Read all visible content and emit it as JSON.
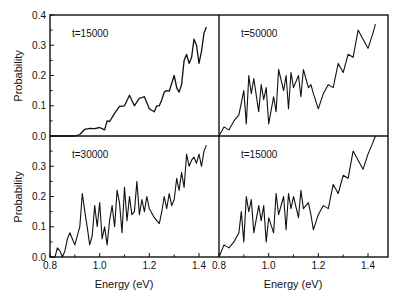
{
  "chart_data": {
    "type": "line",
    "layout": "2x2 panels, shared axes",
    "xlabel": "Energy (eV)",
    "ylabel": "Probability",
    "xlim": [
      0.8,
      1.45
    ],
    "ylim": [
      0.0,
      0.4
    ],
    "x_ticks": [
      "0.8",
      "1.0",
      "1.2",
      "1.4"
    ],
    "y_ticks_top": [
      "0.0",
      "0.1",
      "0.2",
      "0.3",
      "0.4"
    ],
    "y_ticks_bottom": [
      "0.0",
      "0.1",
      "0.2",
      "0.3"
    ],
    "grid": false,
    "legend": "none",
    "panels": [
      {
        "position": "top-left",
        "label": "t=15000",
        "x": [
          0.8,
          0.85,
          0.9,
          0.92,
          0.94,
          0.96,
          0.98,
          1.0,
          1.02,
          1.03,
          1.04,
          1.06,
          1.08,
          1.1,
          1.12,
          1.14,
          1.16,
          1.17,
          1.18,
          1.2,
          1.22,
          1.23,
          1.24,
          1.25,
          1.26,
          1.27,
          1.28,
          1.3,
          1.31,
          1.32,
          1.33,
          1.34,
          1.35,
          1.36,
          1.37,
          1.38,
          1.39,
          1.4,
          1.41,
          1.42,
          1.43
        ],
        "y": [
          0.0,
          0.0,
          0.0,
          0.005,
          0.022,
          0.025,
          0.024,
          0.028,
          0.02,
          0.05,
          0.048,
          0.075,
          0.098,
          0.1,
          0.135,
          0.1,
          0.125,
          0.127,
          0.13,
          0.09,
          0.08,
          0.1,
          0.1,
          0.12,
          0.145,
          0.15,
          0.148,
          0.2,
          0.16,
          0.145,
          0.17,
          0.25,
          0.27,
          0.24,
          0.26,
          0.32,
          0.3,
          0.24,
          0.28,
          0.34,
          0.36
        ]
      },
      {
        "position": "top-right",
        "label": "t=50000",
        "x": [
          0.8,
          0.82,
          0.84,
          0.86,
          0.88,
          0.9,
          0.91,
          0.92,
          0.93,
          0.94,
          0.96,
          0.97,
          0.98,
          0.99,
          1.0,
          1.02,
          1.03,
          1.04,
          1.06,
          1.07,
          1.08,
          1.09,
          1.1,
          1.12,
          1.13,
          1.14,
          1.16,
          1.17,
          1.18,
          1.2,
          1.22,
          1.24,
          1.26,
          1.28,
          1.3,
          1.32,
          1.34,
          1.36,
          1.38,
          1.4,
          1.42,
          1.43
        ],
        "y": [
          0.0,
          0.03,
          0.02,
          0.05,
          0.07,
          0.15,
          0.04,
          0.2,
          0.14,
          0.19,
          0.08,
          0.17,
          0.12,
          0.16,
          0.04,
          0.13,
          0.08,
          0.22,
          0.15,
          0.2,
          0.09,
          0.21,
          0.16,
          0.2,
          0.13,
          0.22,
          0.16,
          0.17,
          0.14,
          0.09,
          0.14,
          0.17,
          0.16,
          0.24,
          0.21,
          0.27,
          0.26,
          0.35,
          0.32,
          0.29,
          0.34,
          0.37
        ]
      },
      {
        "position": "bottom-left",
        "label": "t=30000",
        "x": [
          0.8,
          0.82,
          0.83,
          0.84,
          0.85,
          0.86,
          0.87,
          0.88,
          0.89,
          0.9,
          0.92,
          0.93,
          0.94,
          0.95,
          0.96,
          0.97,
          0.98,
          0.99,
          1.0,
          1.01,
          1.02,
          1.03,
          1.04,
          1.05,
          1.06,
          1.07,
          1.08,
          1.09,
          1.1,
          1.11,
          1.12,
          1.13,
          1.14,
          1.15,
          1.16,
          1.17,
          1.18,
          1.19,
          1.2,
          1.22,
          1.24,
          1.25,
          1.26,
          1.27,
          1.28,
          1.29,
          1.3,
          1.31,
          1.32,
          1.33,
          1.34,
          1.35,
          1.36,
          1.37,
          1.38,
          1.39,
          1.4,
          1.41,
          1.42,
          1.43
        ],
        "y": [
          0.0,
          0.0,
          0.03,
          0.02,
          0.0,
          0.02,
          0.06,
          0.08,
          0.06,
          0.04,
          0.1,
          0.21,
          0.15,
          0.1,
          0.04,
          0.07,
          0.17,
          0.1,
          0.18,
          0.06,
          0.1,
          0.04,
          0.12,
          0.17,
          0.1,
          0.22,
          0.18,
          0.08,
          0.23,
          0.12,
          0.2,
          0.14,
          0.15,
          0.25,
          0.14,
          0.19,
          0.15,
          0.2,
          0.16,
          0.13,
          0.11,
          0.15,
          0.2,
          0.16,
          0.21,
          0.17,
          0.19,
          0.26,
          0.22,
          0.28,
          0.23,
          0.34,
          0.3,
          0.32,
          0.33,
          0.31,
          0.34,
          0.3,
          0.35,
          0.37
        ]
      },
      {
        "position": "bottom-right",
        "label": "t=15000",
        "x": [
          0.8,
          0.82,
          0.84,
          0.86,
          0.88,
          0.89,
          0.9,
          0.91,
          0.92,
          0.93,
          0.94,
          0.96,
          0.97,
          0.98,
          0.99,
          1.0,
          1.02,
          1.03,
          1.04,
          1.06,
          1.07,
          1.08,
          1.09,
          1.1,
          1.12,
          1.13,
          1.14,
          1.16,
          1.17,
          1.18,
          1.2,
          1.22,
          1.24,
          1.26,
          1.28,
          1.3,
          1.32,
          1.34,
          1.36,
          1.38,
          1.4,
          1.42,
          1.43
        ],
        "y": [
          0.0,
          0.04,
          0.03,
          0.05,
          0.08,
          0.15,
          0.05,
          0.2,
          0.15,
          0.19,
          0.08,
          0.17,
          0.12,
          0.17,
          0.05,
          0.13,
          0.08,
          0.21,
          0.14,
          0.2,
          0.09,
          0.21,
          0.16,
          0.2,
          0.13,
          0.22,
          0.16,
          0.18,
          0.14,
          0.09,
          0.14,
          0.17,
          0.16,
          0.24,
          0.21,
          0.27,
          0.26,
          0.35,
          0.32,
          0.29,
          0.34,
          0.38,
          0.41
        ]
      }
    ]
  },
  "labels": {
    "ylabel_top": "Probability",
    "ylabel_bottom": "Probability",
    "xlabel_left": "Energy (eV)",
    "xlabel_right": "Energy (eV)"
  }
}
